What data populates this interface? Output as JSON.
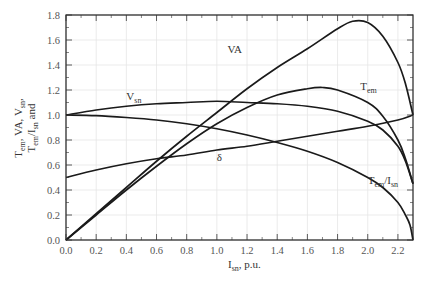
{
  "chart_data": {
    "type": "line",
    "title": "",
    "xlabel": "I_sn, p.u.",
    "ylabel": "T_en, VA, V_sn, T_en/I_sn and δ",
    "xlim": [
      0.0,
      2.3
    ],
    "ylim": [
      0.0,
      1.8
    ],
    "grid": true,
    "x_ticks": [
      "0.0",
      "0.2",
      "0.4",
      "0.6",
      "0.8",
      "1.0",
      "1.2",
      "1.4",
      "1.6",
      "1.8",
      "2.0",
      "2.2"
    ],
    "y_ticks": [
      "0.0",
      "0.2",
      "0.4",
      "0.6",
      "0.8",
      "1.0",
      "1.2",
      "1.4",
      "1.6",
      "1.8"
    ],
    "series": [
      {
        "name": "VA",
        "x": [
          0,
          0.2,
          0.4,
          0.6,
          0.8,
          1.0,
          1.2,
          1.4,
          1.6,
          1.8,
          1.9,
          2.0,
          2.1,
          2.2,
          2.25,
          2.3
        ],
        "values": [
          0,
          0.21,
          0.42,
          0.63,
          0.83,
          1.02,
          1.21,
          1.38,
          1.53,
          1.69,
          1.75,
          1.74,
          1.63,
          1.42,
          1.25,
          1.0
        ]
      },
      {
        "name": "T_en",
        "x": [
          0,
          0.2,
          0.4,
          0.6,
          0.8,
          1.0,
          1.2,
          1.4,
          1.6,
          1.7,
          1.8,
          2.0,
          2.1,
          2.2,
          2.25,
          2.3
        ],
        "values": [
          0,
          0.2,
          0.4,
          0.59,
          0.77,
          0.93,
          1.06,
          1.16,
          1.21,
          1.22,
          1.2,
          1.1,
          0.99,
          0.8,
          0.65,
          0.45
        ]
      },
      {
        "name": "V_sn",
        "x": [
          0,
          0.2,
          0.4,
          0.6,
          0.8,
          1.0,
          1.2,
          1.4,
          1.6,
          1.8,
          2.0,
          2.1,
          2.2,
          2.25,
          2.3
        ],
        "values": [
          1.0,
          1.04,
          1.07,
          1.09,
          1.1,
          1.11,
          1.1,
          1.09,
          1.07,
          1.03,
          0.95,
          0.88,
          0.75,
          0.63,
          0.45
        ]
      },
      {
        "name": "T_en/I_sn",
        "x": [
          0,
          0.2,
          0.4,
          0.6,
          0.8,
          1.0,
          1.2,
          1.4,
          1.6,
          1.8,
          2.0,
          2.1,
          2.2,
          2.25,
          2.28,
          2.3
        ],
        "values": [
          1.0,
          0.995,
          0.98,
          0.96,
          0.93,
          0.89,
          0.84,
          0.78,
          0.71,
          0.62,
          0.5,
          0.42,
          0.3,
          0.2,
          0.12,
          0.0
        ]
      },
      {
        "name": "δ",
        "x": [
          0,
          0.2,
          0.4,
          0.6,
          0.8,
          1.0,
          1.2,
          1.4,
          1.6,
          1.8,
          2.0,
          2.2,
          2.3
        ],
        "values": [
          0.5,
          0.56,
          0.61,
          0.65,
          0.68,
          0.72,
          0.75,
          0.79,
          0.83,
          0.87,
          0.91,
          0.96,
          1.0
        ]
      }
    ],
    "annotations": [
      {
        "text": "VA",
        "x": 1.07,
        "y": 1.5
      },
      {
        "text": "T_en",
        "x": 1.95,
        "y": 1.2
      },
      {
        "text": "V_sn",
        "x": 0.4,
        "y": 1.12
      },
      {
        "text": "δ",
        "x": 1.0,
        "y": 0.63
      },
      {
        "text": "T_en/I_sn",
        "x": 2.0,
        "y": 0.45
      }
    ]
  },
  "labels": {
    "x_axis_main": "I",
    "x_axis_sub": "sn",
    "x_axis_rest": ", p.u.",
    "y_line1": "T_en, VA, V_sn,",
    "y_line2": "T_en/I_sn and"
  }
}
